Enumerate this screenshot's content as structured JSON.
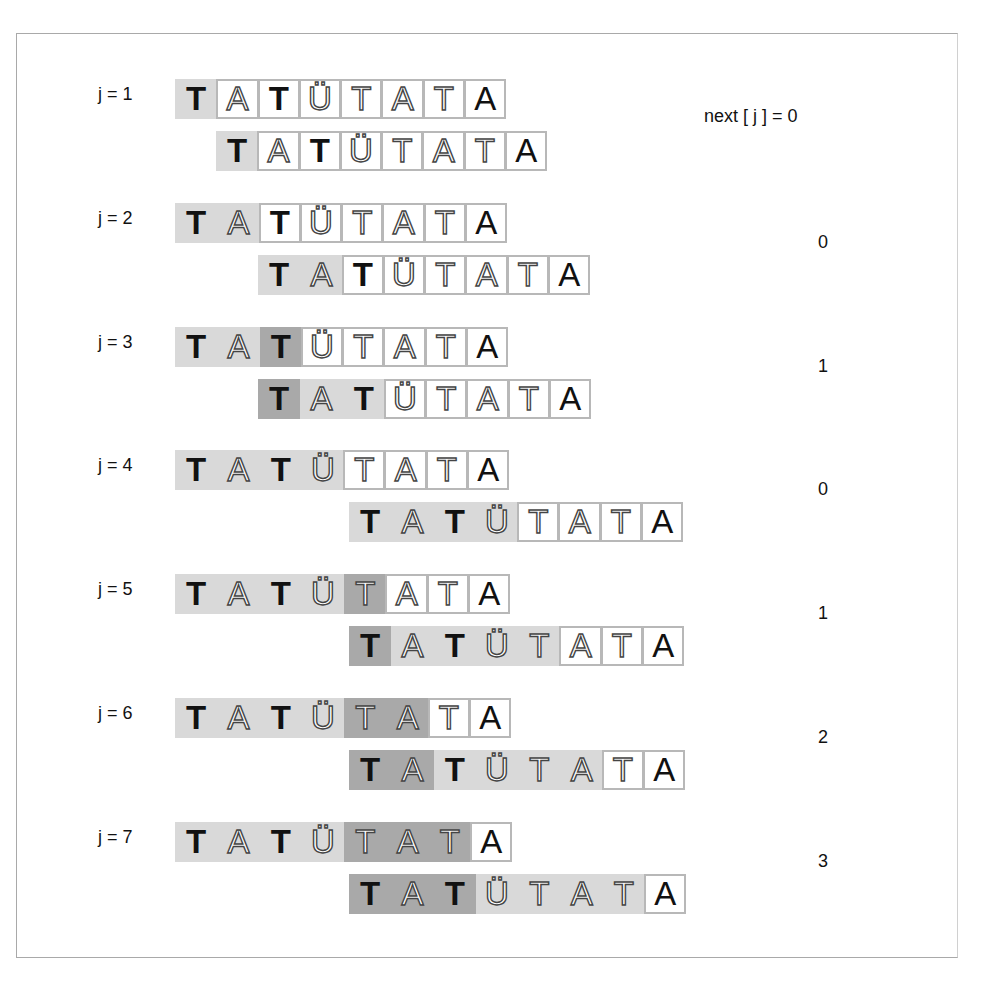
{
  "header": {
    "title_visible": false
  },
  "pattern": {
    "letters": [
      "T",
      "A",
      "T",
      "Ü",
      "T",
      "A",
      "T",
      "A"
    ],
    "letter_styles": [
      "bold",
      "thin",
      "bold",
      "thin",
      "thin",
      "thin",
      "thin",
      "solid"
    ]
  },
  "value_header": "next [ j ] = 0",
  "colors": {
    "light_shade": "#d9d9d9",
    "dark_shade": "#a9a9a9",
    "box_border": "#b8b8b8",
    "frame_border": "#a9a9a9"
  },
  "rows": [
    {
      "label": "j = 1",
      "next": "0",
      "top_y": 79,
      "bottom_x": 216,
      "top_shade": [
        "light",
        "box",
        "box",
        "box",
        "box",
        "box",
        "box",
        "box"
      ],
      "bottom_shade": [
        "light",
        "box",
        "box",
        "box",
        "box",
        "box",
        "box",
        "box"
      ]
    },
    {
      "label": "j = 2",
      "next": "0",
      "top_y": 203,
      "bottom_x": 258,
      "top_shade": [
        "light",
        "light",
        "box",
        "box",
        "box",
        "box",
        "box",
        "box"
      ],
      "bottom_shade": [
        "light",
        "light",
        "box",
        "box",
        "box",
        "box",
        "box",
        "box"
      ]
    },
    {
      "label": "j = 3",
      "next": "1",
      "top_y": 327,
      "bottom_x": 258,
      "top_shade": [
        "light",
        "light",
        "dark",
        "box",
        "box",
        "box",
        "box",
        "box"
      ],
      "bottom_shade": [
        "dark",
        "light",
        "light",
        "box",
        "box",
        "box",
        "box",
        "box"
      ]
    },
    {
      "label": "j = 4",
      "next": "0",
      "top_y": 450,
      "bottom_x": 349,
      "top_shade": [
        "light",
        "light",
        "light",
        "light",
        "box",
        "box",
        "box",
        "box"
      ],
      "bottom_shade": [
        "light",
        "light",
        "light",
        "light",
        "box",
        "box",
        "box",
        "box"
      ]
    },
    {
      "label": "j = 5",
      "next": "1",
      "top_y": 574,
      "bottom_x": 349,
      "top_shade": [
        "light",
        "light",
        "light",
        "light",
        "dark",
        "box",
        "box",
        "box"
      ],
      "bottom_shade": [
        "dark",
        "light",
        "light",
        "light",
        "light",
        "box",
        "box",
        "box"
      ]
    },
    {
      "label": "j = 6",
      "next": "2",
      "top_y": 698,
      "bottom_x": 349,
      "top_shade": [
        "light",
        "light",
        "light",
        "light",
        "dark",
        "dark",
        "box",
        "box"
      ],
      "bottom_shade": [
        "dark",
        "dark",
        "light",
        "light",
        "light",
        "light",
        "box",
        "box"
      ]
    },
    {
      "label": "j = 7",
      "next": "3",
      "top_y": 822,
      "bottom_x": 349,
      "top_shade": [
        "light",
        "light",
        "light",
        "light",
        "dark",
        "dark",
        "dark",
        "box"
      ],
      "bottom_shade": [
        "dark",
        "dark",
        "dark",
        "light",
        "light",
        "light",
        "light",
        "box"
      ]
    }
  ]
}
